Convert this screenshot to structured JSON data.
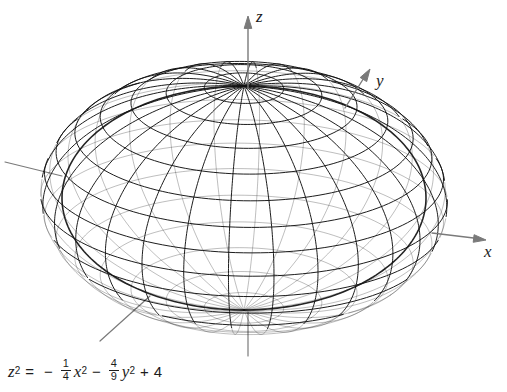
{
  "figure": {
    "background_color": "#ffffff",
    "mesh_color": "#111111",
    "axis_color": "#7a7a7a"
  },
  "axes": {
    "z": {
      "label": "z",
      "direction": "up"
    },
    "y": {
      "label": "y",
      "direction": "up-right"
    },
    "x": {
      "label": "x",
      "direction": "right"
    }
  },
  "equation": {
    "lhs_var": "z",
    "lhs_exp": "2",
    "equals": "=",
    "minus1": "−",
    "frac1_num": "1",
    "frac1_den": "4",
    "term1_var": "x",
    "term1_exp": "2",
    "minus2": "−",
    "frac2_num": "4",
    "frac2_den": "9",
    "term2_var": "y",
    "term2_exp": "2",
    "plus": "+",
    "constant": "4",
    "plain": "z^2 = -1/4 x^2 - 4/9 y^2 + 4"
  },
  "chart_data": {
    "type": "surface",
    "title": "",
    "equation": "z^2 = -(1/4)x^2 - (4/9)y^2 + 4",
    "surface": "ellipsoid",
    "canonical_form": "x^2/4 + y^2/9 + z^2/4 = 1",
    "semi_axes": {
      "a_x": 2,
      "b_y": 3,
      "c_z": 2
    },
    "intercepts": {
      "x": [
        -2,
        2
      ],
      "y": [
        -3,
        3
      ],
      "z": [
        -2,
        2
      ]
    },
    "xlabel": "x",
    "ylabel": "y",
    "zlabel": "z",
    "grid": true,
    "legend": "none",
    "render": {
      "center_px": [
        244,
        198
      ],
      "radius_x_px": 182,
      "radius_y_px": 112,
      "mesh_u_lines": 28,
      "mesh_v_lines": 16,
      "projection": "oblique-axonometric"
    }
  }
}
